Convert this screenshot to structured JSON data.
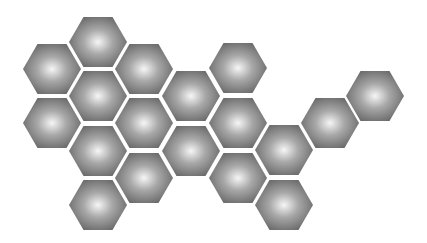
{
  "layout": {
    "width": 427,
    "height": 243,
    "hex_width": 58,
    "hex_height": 50,
    "colors": {
      "background": "#ffffff",
      "hex_center": "#f6f6f6",
      "hex_mid": "#a8a8a8",
      "hex_edge": "#6a6a6a"
    }
  },
  "hexagons": [
    {
      "cx": 52,
      "cy": 69
    },
    {
      "cx": 52,
      "cy": 123
    },
    {
      "cx": 98,
      "cy": 42
    },
    {
      "cx": 98,
      "cy": 96
    },
    {
      "cx": 98,
      "cy": 151
    },
    {
      "cx": 98,
      "cy": 205
    },
    {
      "cx": 144,
      "cy": 69
    },
    {
      "cx": 144,
      "cy": 123
    },
    {
      "cx": 144,
      "cy": 178
    },
    {
      "cx": 191,
      "cy": 96
    },
    {
      "cx": 191,
      "cy": 151
    },
    {
      "cx": 238,
      "cy": 68
    },
    {
      "cx": 238,
      "cy": 123
    },
    {
      "cx": 238,
      "cy": 178
    },
    {
      "cx": 284,
      "cy": 150
    },
    {
      "cx": 284,
      "cy": 205
    },
    {
      "cx": 330,
      "cy": 123
    },
    {
      "cx": 375,
      "cy": 96
    }
  ]
}
